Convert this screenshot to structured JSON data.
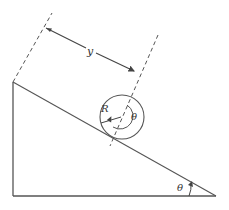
{
  "diagram": {
    "labels": {
      "distance": "y",
      "radius": "R",
      "rotation_angle": "θ",
      "incline_angle": "θ"
    },
    "colors": {
      "stroke": "#555555",
      "background": "#ffffff"
    }
  }
}
